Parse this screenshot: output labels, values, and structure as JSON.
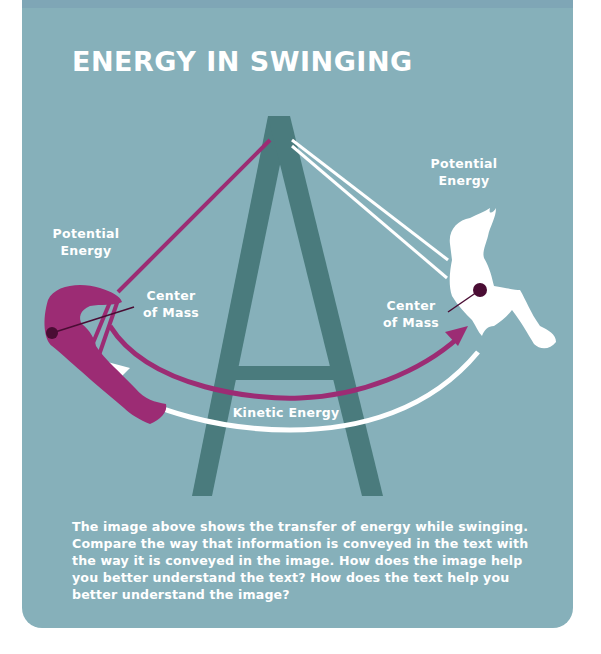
{
  "title": "ENERGY IN SWINGING",
  "labels": {
    "left_potential": "Potential\nEnergy",
    "left_potential_line1": "Potential",
    "left_potential_line2": "Energy",
    "left_center_line1": "Center",
    "left_center_line2": "of Mass",
    "right_potential_line1": "Potential",
    "right_potential_line2": "Energy",
    "right_center_line1": "Center",
    "right_center_line2": "of Mass",
    "kinetic": "Kinetic Energy"
  },
  "caption": "The image above shows the transfer of energy while swinging. Compare the way that information is conveyed in the text with the way it is conveyed in the image. How does the image help you better understand the text? How does the text help you better understand the image?",
  "colors": {
    "background": "#86b0ba",
    "frame": "#4a7b7d",
    "magenta": "#9c2c74",
    "white": "#ffffff",
    "dot": "#4a0d34"
  }
}
